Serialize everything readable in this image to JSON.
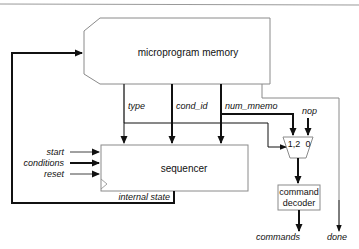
{
  "diagram": {
    "colors": {
      "stroke": "#111111",
      "box_stroke": "#8a8a8a",
      "rule": "#9a9a9a",
      "background": "#ffffff"
    },
    "blocks": {
      "microprogram_memory": {
        "label": "microprogram memory"
      },
      "sequencer": {
        "label": "sequencer"
      },
      "mux": {
        "input_a": "1,2",
        "input_b": "0"
      },
      "command_decoder": {
        "line1": "command",
        "line2": "decoder"
      }
    },
    "fields": {
      "type": "type",
      "cond_id": "cond_id",
      "num_mnemo": "num_mnemo",
      "nop": "nop"
    },
    "sequencer_inputs": {
      "start": "start",
      "conditions": "conditions",
      "reset": "reset"
    },
    "feedback": {
      "internal_state": "internal state"
    },
    "outputs": {
      "commands": "commands",
      "done": "done"
    }
  }
}
